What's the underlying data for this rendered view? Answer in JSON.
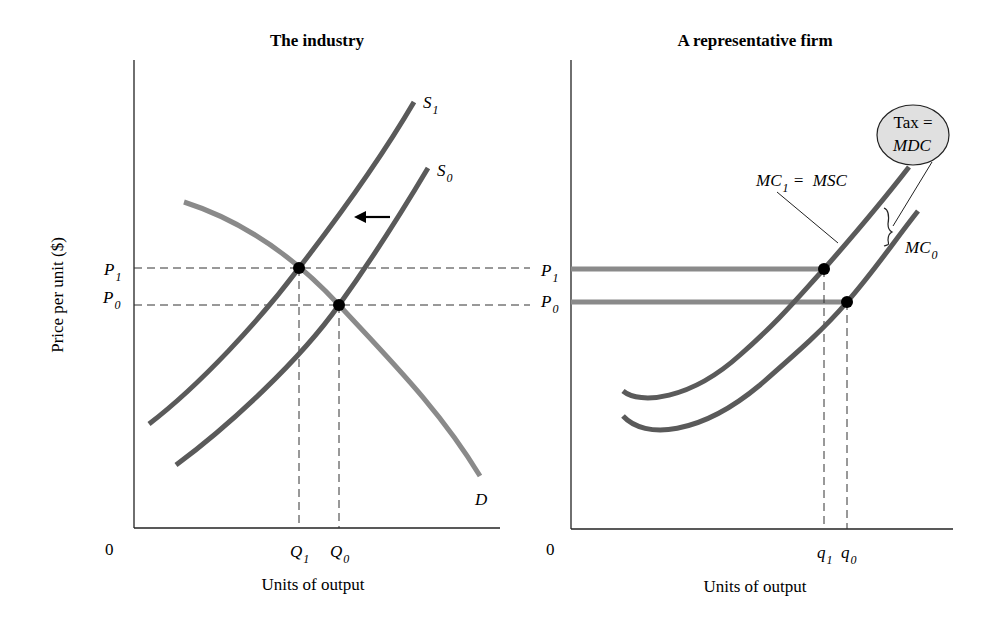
{
  "left_panel": {
    "title": "The industry",
    "y_axis_label": "Price per unit ($)",
    "x_axis_label": "Units of output",
    "origin": "0",
    "labels": {
      "S1": {
        "main": "S",
        "sub": "1"
      },
      "S0": {
        "main": "S",
        "sub": "0"
      },
      "D": "D",
      "P1": {
        "main": "P",
        "sub": "1"
      },
      "P0": {
        "main": "P",
        "sub": "0"
      },
      "Q1": {
        "main": "Q",
        "sub": "1"
      },
      "Q0": {
        "main": "Q",
        "sub": "0"
      }
    }
  },
  "right_panel": {
    "title": "A representative firm",
    "x_axis_label": "Units of output",
    "origin": "0",
    "labels": {
      "P1": {
        "main": "P",
        "sub": "1"
      },
      "P0": {
        "main": "P",
        "sub": "0"
      },
      "q1": {
        "main": "q",
        "sub": "1"
      },
      "q0": {
        "main": "q",
        "sub": "0"
      },
      "MC1_MSC": {
        "main": "MC",
        "sub": "1",
        "rest": " =  MSC"
      },
      "MC0": {
        "main": "MC",
        "sub": "0"
      },
      "tax_bubble": {
        "line1": "Tax =",
        "line2": "MDC"
      }
    }
  },
  "colors": {
    "supply_curve": "#5a5a5a",
    "demand_curve": "#8a8a8a",
    "price_line_firm": "#8a8a8a",
    "bubble_fill": "#e0e0e0",
    "axis": "#222222",
    "point": "#000000"
  }
}
